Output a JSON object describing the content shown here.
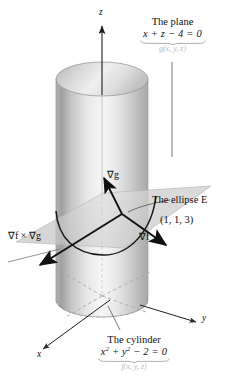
{
  "figure": {
    "kind": "3d-calculus-diagram",
    "background_color": "#ffffff",
    "ink_color": "#111111",
    "ghost_color": "#b9b9b9",
    "surface_light": "#f2f2f2",
    "surface_mid": "#c9c9c9",
    "surface_dark": "#9b9b9b"
  },
  "axes": {
    "z_label": "z",
    "x_label": "x",
    "y_label": "y"
  },
  "labels": {
    "plane": {
      "title": "The plane",
      "equation": "x + z − 4 = 0",
      "function": "g(x, y, z)"
    },
    "cylinder": {
      "title": "The cylinder",
      "equation_html": "x<sup>2</sup> + y<sup>2</sup> − 2 = 0",
      "equation_text": "x2 + y2 − 2 = 0",
      "function": "f(x, y, z)"
    },
    "ellipse": {
      "name": "The ellipse E"
    },
    "point": {
      "coords": "(1, 1, 3)"
    },
    "gradients": {
      "grad_g": "∇g",
      "grad_f": "∇f",
      "cross": "∇f × ∇g"
    }
  }
}
